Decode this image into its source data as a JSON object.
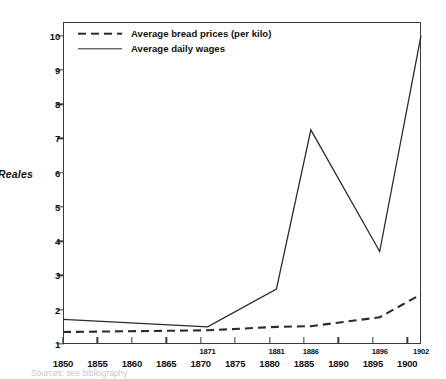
{
  "chart_data": {
    "type": "line",
    "title": "",
    "xlabel": "",
    "ylabel": "Reales",
    "ylim": [
      1,
      10.4
    ],
    "xlim": [
      1850,
      1902
    ],
    "grid": false,
    "legend_position": "top-left",
    "y_ticks": [
      1,
      2,
      3,
      4,
      5,
      6,
      7,
      8,
      9,
      10
    ],
    "x_ticks_major": [
      1850,
      1855,
      1860,
      1865,
      1870,
      1875,
      1880,
      1885,
      1890,
      1895,
      1900
    ],
    "x_ticks_minor": [
      1871,
      1881,
      1886,
      1896,
      1902
    ],
    "series": [
      {
        "name": "Average bread prices (per kilo)",
        "style": "dashed",
        "color": "#2b2b2b",
        "x": [
          1850,
          1871,
          1881,
          1886,
          1896,
          1902
        ],
        "values": [
          1.35,
          1.4,
          1.5,
          1.52,
          1.78,
          2.45
        ]
      },
      {
        "name": "Average daily wages",
        "style": "solid",
        "color": "#2b2b2b",
        "x": [
          1850,
          1871,
          1881,
          1886,
          1896,
          1902
        ],
        "values": [
          1.72,
          1.5,
          2.6,
          7.25,
          3.7,
          10.0
        ]
      }
    ]
  },
  "axes": {
    "y_title": "Reales",
    "y_tick_labels": [
      "1",
      "2",
      "3",
      "4",
      "5",
      "6",
      "7",
      "8",
      "9",
      "10"
    ],
    "x_major_labels": [
      "1850",
      "1855",
      "1860",
      "1865",
      "1870",
      "1875",
      "1880",
      "1885",
      "1890",
      "1895",
      "1900"
    ],
    "x_minor_labels": [
      "1871",
      "1881",
      "1886",
      "1896",
      "1902"
    ]
  },
  "legend": {
    "items": [
      {
        "label": "Average bread prices (per kilo)",
        "style": "dashed"
      },
      {
        "label": "Average daily wages",
        "style": "solid"
      }
    ]
  },
  "caption": {
    "text": "Sources: see bibliography"
  }
}
